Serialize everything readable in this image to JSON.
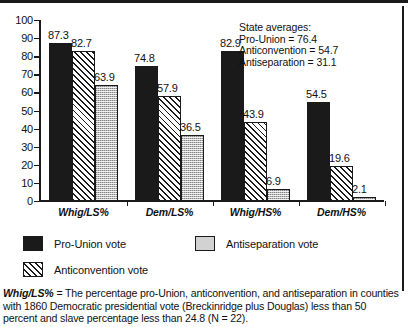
{
  "chart_data": {
    "type": "bar",
    "title": "",
    "xlabel": "",
    "ylabel": "",
    "ylim": [
      0,
      100
    ],
    "yticks": [
      0,
      10,
      20,
      30,
      40,
      50,
      60,
      70,
      80,
      90,
      100
    ],
    "grid": false,
    "legend_position": "bottom",
    "categories": [
      "Whig/LS%",
      "Dem/LS%",
      "Whig/HS%",
      "Dem/HS%"
    ],
    "series": [
      {
        "name": "Pro-Union vote",
        "pattern": "solid",
        "values": [
          87.3,
          74.8,
          82.9,
          54.5
        ]
      },
      {
        "name": "Anticonvention vote",
        "pattern": "hatch",
        "values": [
          82.7,
          57.9,
          43.9,
          19.6
        ]
      },
      {
        "name": "Antiseparation vote",
        "pattern": "dotted",
        "values": [
          63.9,
          36.5,
          6.9,
          2.1
        ]
      }
    ],
    "annotations": {
      "state_averages_title": "State averages:",
      "state_averages": [
        "Pro-Union = 76.4",
        "Anticonvention = 54.7",
        "Antiseparation = 31.1"
      ]
    }
  },
  "legend": {
    "items": [
      {
        "label": "Pro-Union vote",
        "pattern": "solid"
      },
      {
        "label": "Antiseparation vote",
        "pattern": "dotted"
      },
      {
        "label": "Anticonvention vote",
        "pattern": "hatch"
      }
    ]
  },
  "caption": {
    "term": "Whig/LS%",
    "text": " = The percentage pro-Union, anticonvention, and antiseparation in counties with 1860 Democratic presidential vote (Breckinridge plus Douglas) less than 50 percent and slave percentage less than 24.8 (N = 22)."
  },
  "colors": {
    "ink": "#1a1a1a",
    "gray_fill": "#b9b9b9",
    "background": "#ffffff"
  }
}
